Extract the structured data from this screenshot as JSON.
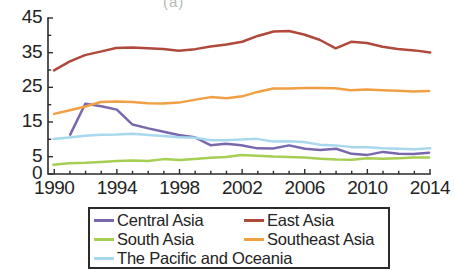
{
  "figure": {
    "partial_top_label": "(a)",
    "background": "#ffffff",
    "ink": "#2b2b2b"
  },
  "axes": {
    "y_tick_labels": [
      "45",
      "35",
      "25",
      "15",
      "5",
      "0"
    ],
    "y_tick_values": [
      45,
      35,
      25,
      15,
      5,
      0
    ],
    "y_minor_values": [
      10,
      20,
      30,
      40
    ],
    "x_tick_labels": [
      "1990",
      "1994",
      "1998",
      "2002",
      "2006",
      "2010",
      "2014"
    ],
    "x_tick_values": [
      1990,
      1994,
      1998,
      2002,
      2006,
      2010,
      2014
    ]
  },
  "legend": {
    "items": [
      {
        "label": "Central Asia",
        "color": "#7a68ad"
      },
      {
        "label": "East Asia",
        "color": "#b1483c"
      },
      {
        "label": "South Asia",
        "color": "#a5cf53"
      },
      {
        "label": "Southeast Asia",
        "color": "#f0a044"
      },
      {
        "label": "The Pacific and Oceania",
        "color": "#a8d8ee"
      }
    ]
  },
  "chart_data": {
    "type": "line",
    "title": "",
    "subtitle": "",
    "xlabel": "",
    "ylabel": "",
    "xlim": [
      1989.6,
      2014.0
    ],
    "ylim": [
      0,
      45
    ],
    "grid": false,
    "legend_position": "below-axes",
    "x": [
      1990,
      1991,
      1992,
      1993,
      1994,
      1995,
      1996,
      1997,
      1998,
      1999,
      2000,
      2001,
      2002,
      2003,
      2004,
      2005,
      2006,
      2007,
      2008,
      2009,
      2010,
      2011,
      2012,
      2013,
      2014
    ],
    "series": [
      {
        "name": "Central Asia",
        "color": "#7a68ad",
        "start_year": 1991,
        "values": [
          null,
          11.3,
          20.2,
          19.6,
          18.3,
          14.0,
          13.0,
          12.1,
          11.1,
          10.5,
          8.2,
          8.5,
          8.4,
          7.4,
          7.3,
          8.3,
          7.3,
          6.9,
          7.2,
          5.7,
          5.4,
          6.2,
          5.7,
          5.6,
          6.0
        ]
      },
      {
        "name": "East Asia",
        "color": "#b1483c",
        "start_year": 1990,
        "values": [
          29.8,
          32.3,
          34.0,
          35.0,
          36.2,
          36.4,
          36.2,
          36.0,
          35.6,
          36.0,
          36.8,
          37.4,
          38.0,
          39.7,
          40.9,
          41.1,
          40.0,
          38.6,
          36.1,
          38.0,
          37.8,
          36.8,
          36.0,
          35.6,
          35.1
        ]
      },
      {
        "name": "South Asia",
        "color": "#a5cf53",
        "start_year": 1990,
        "values": [
          2.6,
          3.0,
          3.3,
          3.5,
          3.8,
          3.9,
          3.6,
          4.0,
          3.9,
          4.2,
          4.4,
          4.8,
          5.2,
          5.3,
          5.1,
          4.9,
          4.8,
          4.5,
          4.2,
          4.2,
          4.3,
          4.2,
          4.3,
          4.5,
          4.6
        ]
      },
      {
        "name": "Southeast Asia",
        "color": "#f0a044",
        "start_year": 1990,
        "values": [
          17.1,
          18.3,
          19.2,
          20.5,
          20.6,
          20.5,
          20.4,
          20.4,
          20.6,
          21.3,
          22.2,
          21.8,
          22.4,
          23.6,
          24.4,
          24.5,
          24.6,
          24.7,
          24.6,
          24.0,
          24.3,
          24.1,
          24.0,
          23.9,
          24.0
        ]
      },
      {
        "name": "The Pacific and Oceania",
        "color": "#a8d8ee",
        "start_year": 1990,
        "values": [
          10.2,
          10.5,
          11.0,
          11.3,
          11.3,
          11.6,
          11.2,
          10.8,
          10.4,
          10.2,
          9.6,
          9.5,
          9.8,
          10.0,
          9.5,
          9.4,
          9.2,
          8.4,
          8.2,
          7.8,
          7.6,
          7.3,
          7.1,
          7.0,
          7.2
        ]
      }
    ]
  }
}
